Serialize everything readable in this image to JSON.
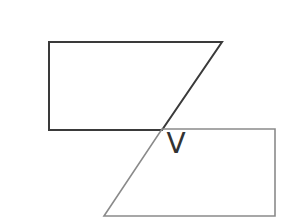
{
  "diagram": {
    "background": "#ffffff",
    "shapes": [
      {
        "id": "upper-trapezoid",
        "points": [
          [
            49,
            42
          ],
          [
            222,
            42
          ],
          [
            162,
            130
          ],
          [
            49,
            130
          ]
        ],
        "stroke": "#3a3a3a",
        "stroke_width": 2
      },
      {
        "id": "lower-trapezoid",
        "points": [
          [
            162,
            129
          ],
          [
            275,
            129
          ],
          [
            275,
            216
          ],
          [
            104,
            216
          ]
        ],
        "stroke": "#8a8a8a",
        "stroke_width": 1.6
      }
    ],
    "label": {
      "text": "V",
      "x": 176,
      "y": 153,
      "color": "#333333"
    }
  }
}
